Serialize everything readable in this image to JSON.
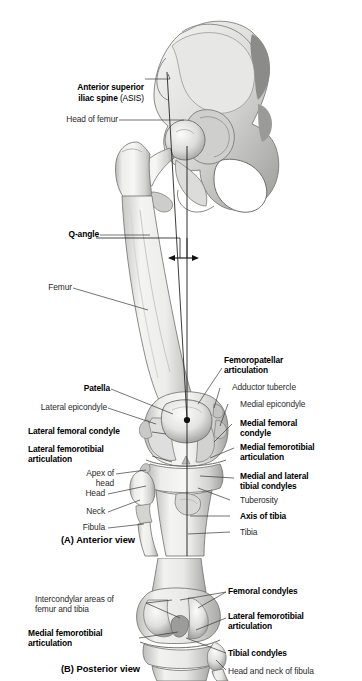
{
  "figure": {
    "panels": [
      {
        "id": "A",
        "caption": "(A) Anterior view"
      },
      {
        "id": "B",
        "caption": "(B) Posterior view"
      }
    ]
  },
  "panel_a": {
    "caption": "(A) Anterior view",
    "labels_left": [
      {
        "name": "asis",
        "text": "Anterior superior\niliac spine",
        "suffix": " (ASIS)",
        "bold": true
      },
      {
        "name": "head-of-femur",
        "text": "Head of femur",
        "bold": false
      },
      {
        "name": "q-angle",
        "text": "Q-angle",
        "bold": true
      },
      {
        "name": "femur",
        "text": "Femur",
        "bold": false
      },
      {
        "name": "patella",
        "text": "Patella",
        "bold": true
      },
      {
        "name": "lateral-epicondyle",
        "text": "Lateral epicondyle",
        "bold": false
      },
      {
        "name": "lateral-femoral-condyle",
        "text": "Lateral femoral condyle",
        "bold": true
      },
      {
        "name": "lateral-femorotibial-articulation",
        "text": "Lateral femorotibial\narticulation",
        "bold": true
      },
      {
        "name": "apex-of-head",
        "text": "Apex of\nhead",
        "bold": false
      },
      {
        "name": "head",
        "text": "Head",
        "bold": false
      },
      {
        "name": "neck",
        "text": "Neck",
        "bold": false
      },
      {
        "name": "fibula",
        "text": "Fibula",
        "bold": false
      }
    ],
    "labels_right": [
      {
        "name": "femoropatellar-articulation",
        "text": "Femoropatellar\narticulation",
        "bold": true
      },
      {
        "name": "adductor-tubercle",
        "text": "Adductor tubercle",
        "bold": false
      },
      {
        "name": "medial-epicondyle",
        "text": "Medial epicondyle",
        "bold": false
      },
      {
        "name": "medial-femoral-condyle",
        "text": "Medial femoral\ncondyle",
        "bold": true
      },
      {
        "name": "medial-femorotibial-articulation",
        "text": "Medial femorotibial\narticulation",
        "bold": true
      },
      {
        "name": "medial-and-lateral-tibial-condyles",
        "text": "Medial and lateral\ntibial condyles",
        "bold": true
      },
      {
        "name": "tuberosity",
        "text": "Tuberosity",
        "bold": false
      },
      {
        "name": "axis-of-tibia",
        "text": "Axis of tibia",
        "bold": true
      },
      {
        "name": "tibia",
        "text": "Tibia",
        "bold": false
      }
    ]
  },
  "panel_b": {
    "caption": "(B) Posterior view",
    "labels_left": [
      {
        "name": "intercondylar-areas",
        "text": "Intercondylar areas of\nfemur and tibia",
        "bold": false
      },
      {
        "name": "medial-femorotibial-articulation-post",
        "text": "Medial femorotibial\narticulation",
        "bold": true
      }
    ],
    "labels_right": [
      {
        "name": "femoral-condyles",
        "text": "Femoral condyles",
        "bold": true
      },
      {
        "name": "lateral-femorotibial-articulation-post",
        "text": "Lateral femorotibial\narticulation",
        "bold": true
      },
      {
        "name": "tibial-condyles",
        "text": "Tibial condyles",
        "bold": true
      },
      {
        "name": "head-and-neck-of-fibula",
        "text": "Head and neck of fibula",
        "bold": false
      }
    ]
  },
  "colors": {
    "background": "#ffffff",
    "text": "#2b2b2b",
    "text_bold": "#000000",
    "leader_line": "#3a3a3a",
    "axis_line": "#1a1a1a",
    "bone_light": "#f2f2f0",
    "bone_mid": "#d8d8d6",
    "bone_shade": "#a8a8a6",
    "bone_dark": "#7d7d7b",
    "bone_outline": "#6e6e6c"
  }
}
